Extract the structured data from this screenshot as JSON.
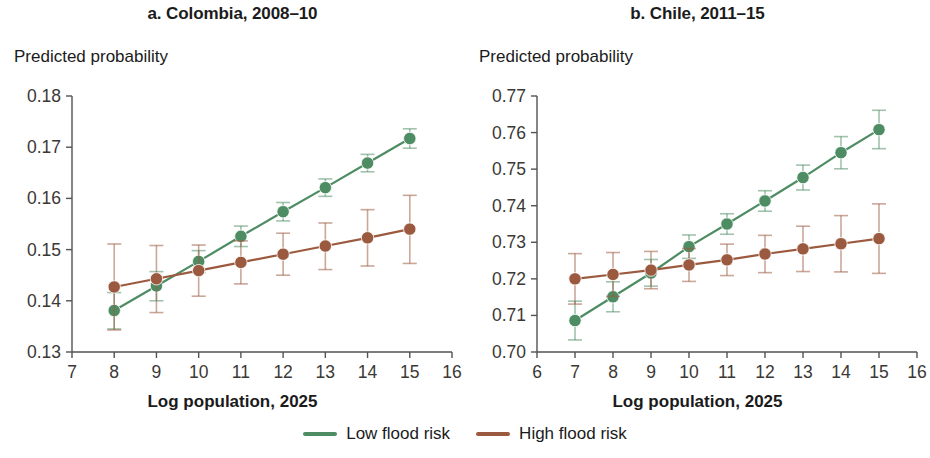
{
  "figure": {
    "legend": {
      "items": [
        {
          "label": "Low flood risk",
          "color": "#4e8c63",
          "name": "low-flood-risk"
        },
        {
          "label": "High flood risk",
          "color": "#9b5a3f",
          "name": "high-flood-risk"
        }
      ]
    }
  },
  "chart_data": [
    {
      "type": "line",
      "title": "a. Colombia, 2008–10",
      "xlabel": "Log population, 2025",
      "ylabel": "Predicted probability",
      "x": [
        8,
        9,
        10,
        11,
        12,
        13,
        14,
        15
      ],
      "xlim": [
        7,
        16
      ],
      "ylim": [
        0.13,
        0.18
      ],
      "xticks": [
        7,
        8,
        9,
        10,
        11,
        12,
        13,
        14,
        15,
        16
      ],
      "xticklabels": [
        "7",
        "8",
        "9",
        "10",
        "11",
        "12",
        "13",
        "14",
        "15",
        "16"
      ],
      "yticks": [
        0.13,
        0.14,
        0.15,
        0.16,
        0.17,
        0.18
      ],
      "yticklabels": [
        "0.13",
        "0.14",
        "0.15",
        "0.16",
        "0.17",
        "0.18"
      ],
      "grid": false,
      "legend_position": "bottom-center",
      "series": [
        {
          "name": "Low flood risk",
          "color": "#4e8c63",
          "values": [
            0.1381,
            0.1429,
            0.1477,
            0.1526,
            0.1574,
            0.1621,
            0.1669,
            0.1717
          ],
          "err_low": [
            0.1345,
            0.14,
            0.1455,
            0.1506,
            0.1556,
            0.1604,
            0.1652,
            0.1698
          ],
          "err_high": [
            0.1416,
            0.1457,
            0.1498,
            0.1546,
            0.1592,
            0.1638,
            0.1686,
            0.1736
          ]
        },
        {
          "name": "High flood risk",
          "color": "#9b5a3f",
          "values": [
            0.1427,
            0.1443,
            0.1459,
            0.1475,
            0.1491,
            0.1507,
            0.1523,
            0.154
          ],
          "err_low": [
            0.1343,
            0.1377,
            0.1409,
            0.1433,
            0.145,
            0.1461,
            0.1468,
            0.1473
          ],
          "err_high": [
            0.1511,
            0.1508,
            0.1509,
            0.1517,
            0.1532,
            0.1552,
            0.1578,
            0.1606
          ]
        }
      ]
    },
    {
      "type": "line",
      "title": "b. Chile, 2011–15",
      "xlabel": "Log population, 2025",
      "ylabel": "Predicted probability",
      "x": [
        7,
        8,
        9,
        10,
        11,
        12,
        13,
        14,
        15
      ],
      "xlim": [
        6,
        16
      ],
      "ylim": [
        0.7,
        0.77
      ],
      "xticks": [
        6,
        7,
        8,
        9,
        10,
        11,
        12,
        13,
        14,
        15,
        16
      ],
      "xticklabels": [
        "6",
        "7",
        "8",
        "9",
        "10",
        "11",
        "12",
        "13",
        "14",
        "15",
        "16"
      ],
      "yticks": [
        0.7,
        0.71,
        0.72,
        0.73,
        0.74,
        0.75,
        0.76,
        0.77
      ],
      "yticklabels": [
        "0.70",
        "0.71",
        "0.72",
        "0.73",
        "0.74",
        "0.75",
        "0.76",
        "0.77"
      ],
      "grid": false,
      "legend_position": "bottom-center",
      "series": [
        {
          "name": "Low flood risk",
          "color": "#4e8c63",
          "values": [
            0.7086,
            0.7151,
            0.7216,
            0.7288,
            0.735,
            0.7413,
            0.7477,
            0.7545,
            0.7608
          ],
          "err_low": [
            0.7033,
            0.711,
            0.718,
            0.7256,
            0.7322,
            0.7385,
            0.7443,
            0.7501,
            0.7556
          ],
          "err_high": [
            0.7139,
            0.7192,
            0.7253,
            0.732,
            0.7378,
            0.7441,
            0.7511,
            0.7589,
            0.7661
          ]
        },
        {
          "name": "High flood risk",
          "color": "#9b5a3f",
          "values": [
            0.72,
            0.7212,
            0.7224,
            0.7238,
            0.7252,
            0.7268,
            0.7282,
            0.7296,
            0.731
          ],
          "err_low": [
            0.7131,
            0.7152,
            0.7173,
            0.7193,
            0.7209,
            0.7217,
            0.722,
            0.7219,
            0.7215
          ],
          "err_high": [
            0.7269,
            0.7272,
            0.7275,
            0.7283,
            0.7295,
            0.7319,
            0.7344,
            0.7373,
            0.7405
          ]
        }
      ]
    }
  ]
}
